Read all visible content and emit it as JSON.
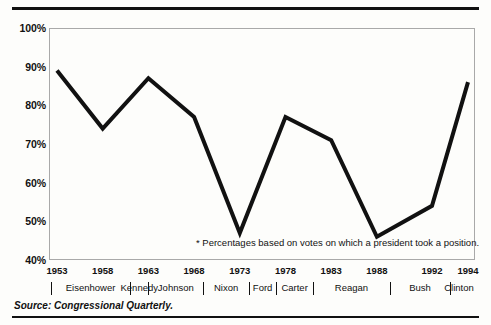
{
  "chart_data": {
    "type": "line",
    "title": "",
    "subtitle": "",
    "xlabel": "",
    "ylabel": "",
    "x": [
      1953,
      1958,
      1963,
      1968,
      1973,
      1978,
      1983,
      1988,
      1992,
      1994
    ],
    "values": [
      89,
      74,
      87,
      77,
      47,
      77,
      71,
      46,
      54,
      86
    ],
    "series": [
      {
        "name": "Presidential success rate on congressional votes",
        "values": [
          89,
          74,
          87,
          77,
          47,
          77,
          71,
          46,
          54,
          86
        ]
      }
    ],
    "xlim": [
      1953,
      1994
    ],
    "ylim": [
      40,
      100
    ],
    "ytick_labels": [
      "100%",
      "90%",
      "80%",
      "70%",
      "60%",
      "50%",
      "40%"
    ],
    "ytick_values": [
      100,
      90,
      80,
      70,
      60,
      50,
      40
    ],
    "xtick_labels": [
      "1953",
      "1958",
      "1963",
      "1968",
      "1973",
      "1978",
      "1983",
      "1988",
      "1992",
      "1994"
    ],
    "grid": false,
    "legend": "none",
    "line_color": "#111111",
    "frame_color": "#a9a9a9",
    "annotations": [
      "* Percentages based on votes on which a president took a position."
    ],
    "presidents": [
      {
        "name": "Eisenhower",
        "start_year": 1953,
        "end_year": 1961
      },
      {
        "name": "Kennedy",
        "start_year": 1961,
        "end_year": 1963
      },
      {
        "name": "Johnson",
        "start_year": 1963,
        "end_year": 1969
      },
      {
        "name": "Nixon",
        "start_year": 1969,
        "end_year": 1974
      },
      {
        "name": "Ford",
        "start_year": 1974,
        "end_year": 1977
      },
      {
        "name": "Carter",
        "start_year": 1977,
        "end_year": 1981
      },
      {
        "name": "Reagan",
        "start_year": 1981,
        "end_year": 1989
      },
      {
        "name": "Bush",
        "start_year": 1989,
        "end_year": 1993
      },
      {
        "name": "Clinton",
        "start_year": 1993,
        "end_year": 1994
      }
    ]
  },
  "footer": {
    "source": "Source: Congressional Quarterly."
  }
}
